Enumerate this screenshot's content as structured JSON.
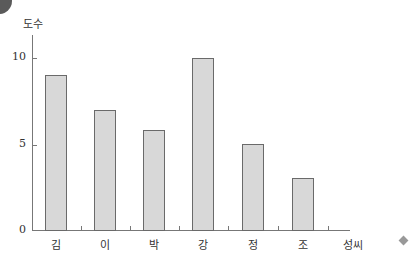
{
  "chart_data": {
    "type": "bar",
    "title": "",
    "xlabel": "성씨",
    "ylabel": "도수",
    "categories": [
      "김",
      "이",
      "박",
      "강",
      "정",
      "조"
    ],
    "values": [
      9,
      7,
      5.8,
      10,
      5,
      3
    ],
    "yticks": [
      "0",
      "5",
      "10"
    ],
    "ylim": [
      0,
      11
    ],
    "grid": false,
    "legend": "none"
  },
  "axis": {
    "ylabel": "도수",
    "xlabel": "성씨",
    "yticks": {
      "t0": "0",
      "t5": "5",
      "t10": "10"
    }
  },
  "bars": [
    {
      "label": "김",
      "value": 9
    },
    {
      "label": "이",
      "value": 7
    },
    {
      "label": "박",
      "value": 5.8
    },
    {
      "label": "강",
      "value": 10
    },
    {
      "label": "정",
      "value": 5
    },
    {
      "label": "조",
      "value": 3
    }
  ]
}
